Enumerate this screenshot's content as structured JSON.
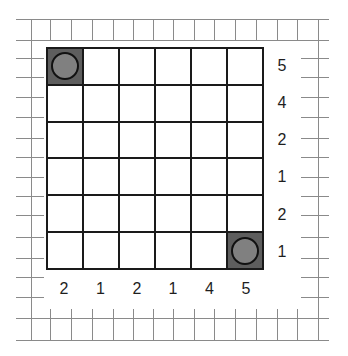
{
  "puzzle": {
    "size": 6,
    "colors": {
      "grid_line": "#1a1a1a",
      "shaded_cell": "#5e5e5e",
      "piece_fill": "#808080",
      "piece_border": "#111111",
      "frame_line": "#8a8a8a",
      "clue_text": "#1e1e1e"
    },
    "row_clues": [
      "5",
      "4",
      "2",
      "1",
      "2",
      "1"
    ],
    "column_clues": [
      "2",
      "1",
      "2",
      "1",
      "4",
      "5"
    ],
    "cells": [
      [
        {
          "shaded": true,
          "piece": "circle"
        },
        {},
        {},
        {},
        {},
        {}
      ],
      [
        {},
        {},
        {},
        {},
        {},
        {}
      ],
      [
        {},
        {},
        {},
        {},
        {},
        {}
      ],
      [
        {},
        {},
        {},
        {},
        {},
        {}
      ],
      [
        {},
        {},
        {},
        {},
        {},
        {}
      ],
      [
        {},
        {},
        {},
        {},
        {},
        {
          "shaded": true,
          "piece": "circle"
        }
      ]
    ]
  }
}
